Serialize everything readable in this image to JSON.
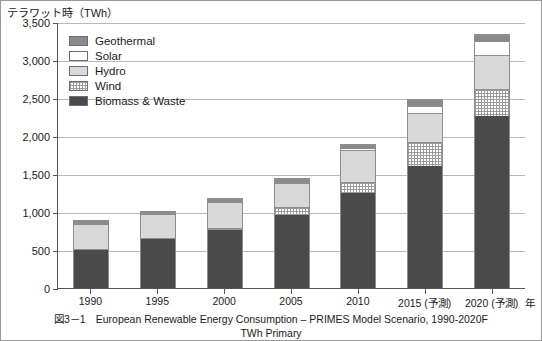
{
  "figure": {
    "y_axis_unit": "テラワット時（TWh）",
    "x_axis_unit": "年",
    "caption_number": "図3－1",
    "caption_line1": "European Renewable Energy Consumption – PRIMES Model Scenario, 1990-2020F",
    "caption_line2": "TWh Primary"
  },
  "legend": {
    "items": [
      {
        "label": "Geothermal",
        "icon": "swatch-geothermal",
        "color": "#8a8a8a"
      },
      {
        "label": "Solar",
        "icon": "swatch-solar",
        "color": "#ffffff"
      },
      {
        "label": "Hydro",
        "icon": "swatch-hydro",
        "color": "#d9d9d9"
      },
      {
        "label": "Wind",
        "icon": "swatch-wind",
        "color": "#ffffff"
      },
      {
        "label": "Biomass & Waste",
        "icon": "swatch-biomass",
        "color": "#4a4a4a"
      }
    ]
  },
  "chart_data": {
    "type": "bar",
    "stacked": true,
    "title": "European Renewable Energy Consumption – PRIMES Model Scenario, 1990-2020F",
    "subtitle": "TWh Primary",
    "xlabel": "年",
    "ylabel": "テラワット時（TWh）",
    "ylim": [
      0,
      3500
    ],
    "ytick_labels": [
      "3,500",
      "3,000",
      "2,500",
      "2,000",
      "1,500",
      "1,000",
      "500",
      "0"
    ],
    "ytick_values": [
      3500,
      3000,
      2500,
      2000,
      1500,
      1000,
      500,
      0
    ],
    "grid": true,
    "legend_position": "upper-left-inside",
    "categories": [
      "1990",
      "1995",
      "2000",
      "2005",
      "2010",
      "2015 (予測)",
      "2020 (予測)"
    ],
    "series": [
      {
        "name": "Biomass & Waste",
        "values": [
          500,
          640,
          760,
          960,
          1250,
          1610,
          2260
        ]
      },
      {
        "name": "Wind",
        "values": [
          5,
          10,
          30,
          100,
          150,
          310,
          360
        ]
      },
      {
        "name": "Hydro",
        "values": [
          330,
          320,
          340,
          320,
          410,
          380,
          440
        ]
      },
      {
        "name": "Solar",
        "values": [
          5,
          10,
          15,
          20,
          30,
          90,
          190
        ]
      },
      {
        "name": "Geothermal",
        "values": [
          20,
          20,
          30,
          30,
          40,
          80,
          80
        ]
      }
    ],
    "totals": [
      860,
      1000,
      1175,
      1430,
      1880,
      2470,
      3330
    ]
  }
}
